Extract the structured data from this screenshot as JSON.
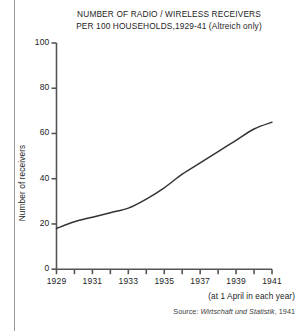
{
  "figure": {
    "title_line1": "NUMBER OF RADIO / WIRELESS RECEIVERS",
    "title_line2": "PER 100 HOUSEHOLDS,1929-41 (Altreich only)",
    "xnote": "(at 1 April in each year)",
    "source_prefix": "Source:",
    "source_title": "Wirtschaft und Statistik",
    "source_year": ", 1941",
    "line_color": "#333333",
    "axis_color": "#555555",
    "rule_color": "#9a9a9e"
  },
  "chart_data": {
    "type": "line",
    "title": "NUMBER OF RADIO / WIRELESS RECEIVERS PER 100 HOUSEHOLDS,1929-41 (Altreich only)",
    "xlabel": "",
    "ylabel": "Number of receivers",
    "xlim": [
      1929,
      1941
    ],
    "ylim": [
      0,
      100
    ],
    "grid": false,
    "legend": "none",
    "x": [
      1929,
      1930,
      1931,
      1932,
      1933,
      1934,
      1935,
      1936,
      1937,
      1938,
      1939,
      1940,
      1941
    ],
    "values": [
      18,
      21,
      23,
      25,
      27,
      31,
      36,
      42,
      47,
      52,
      57,
      62,
      65
    ],
    "y_ticks": [
      0,
      20,
      40,
      60,
      80,
      100
    ],
    "y_tick_labels": [
      "0",
      "20",
      "40",
      "60",
      "80",
      "100"
    ],
    "x_ticks": [
      1929,
      1930,
      1931,
      1932,
      1933,
      1934,
      1935,
      1936,
      1937,
      1938,
      1939,
      1940,
      1941
    ],
    "x_tick_labels_shown": [
      "1929",
      "1931",
      "1933",
      "1935",
      "1937",
      "1939",
      "1941"
    ],
    "annotations": [
      "(at 1 April in each year)",
      "Source: Wirtschaft und Statistik, 1941"
    ]
  }
}
